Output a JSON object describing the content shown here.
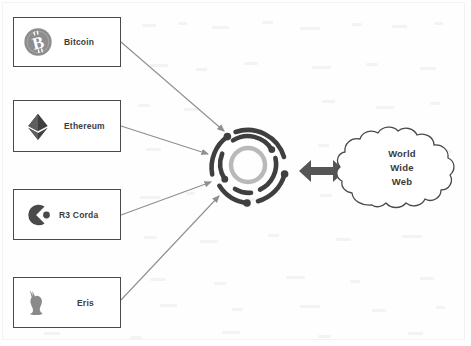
{
  "diagram": {
    "colors": {
      "box_border": "#4a4a4a",
      "arrow": "#8f8f8f",
      "hub_dark": "#3f3f3f",
      "hub_light": "#b9b9b9",
      "cloud_border": "#4a4a4a",
      "text": "#3d3d3d",
      "double_arrow": "#555555"
    },
    "platforms": [
      {
        "id": "bitcoin",
        "label": "Bitcoin",
        "icon": "bitcoin-logo-icon"
      },
      {
        "id": "ethereum",
        "label": "Ethereum",
        "icon": "ethereum-logo-icon"
      },
      {
        "id": "corda",
        "label": "R3 Corda",
        "icon": "r3-corda-logo-icon"
      },
      {
        "id": "eris",
        "label": "Eris",
        "icon": "eris-rabbit-logo-icon"
      }
    ],
    "hub": {
      "name": "blockchain-network-hub-icon",
      "description": "concentric rings of arc segments with node dots"
    },
    "cloud": {
      "line1": "World",
      "line2": "Wide",
      "line3": "Web"
    },
    "connectors": {
      "platform_to_hub": "arrow",
      "hub_to_cloud": "double-headed-arrow"
    }
  }
}
